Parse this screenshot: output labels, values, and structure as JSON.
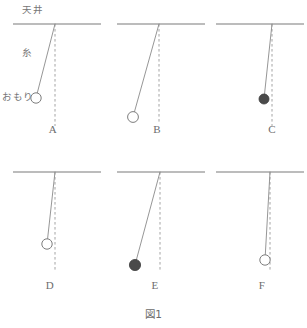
{
  "figure": {
    "caption": "図1",
    "annotations": {
      "ceiling_label": "天井",
      "string_label": "糸",
      "bob_label": "おもり"
    },
    "colors": {
      "ceiling_stroke": "#7a7a7a",
      "string_stroke": "#8a8a8a",
      "dashed_stroke": "#9a9a9a",
      "bob_open_fill": "#ffffff",
      "bob_open_stroke": "#7d7d7d",
      "bob_filled_fill": "#4a4a4a",
      "text_color": "#6d6d6d",
      "background": "#ffffff"
    }
  },
  "panels": [
    {
      "label": "A",
      "bob_style": "open",
      "pivot_x": 55,
      "pivot_y": 24,
      "ceiling_x1": 13,
      "ceiling_x2": 101,
      "bob_x": 36,
      "bob_y": 98,
      "bob_r": 5.2,
      "dash_y2": 126,
      "label_x": 53,
      "label_y": 123
    },
    {
      "label": "B",
      "bob_style": "open",
      "pivot_x": 159,
      "pivot_y": 24,
      "ceiling_x1": 117,
      "ceiling_x2": 205,
      "bob_x": 133,
      "bob_y": 117,
      "bob_r": 5.4,
      "dash_y2": 124,
      "label_x": 157,
      "label_y": 123
    },
    {
      "label": "C",
      "bob_style": "filled",
      "pivot_x": 272,
      "pivot_y": 24,
      "ceiling_x1": 216,
      "ceiling_x2": 304,
      "bob_x": 264,
      "bob_y": 99,
      "bob_r": 5.0,
      "dash_y2": 126,
      "label_x": 272,
      "label_y": 123
    },
    {
      "label": "D",
      "bob_style": "open",
      "pivot_x": 55,
      "pivot_y": 172,
      "ceiling_x1": 13,
      "ceiling_x2": 101,
      "bob_x": 47,
      "bob_y": 244,
      "bob_r": 5.2,
      "dash_y2": 272,
      "label_x": 50,
      "label_y": 279
    },
    {
      "label": "E",
      "bob_style": "filled",
      "pivot_x": 160,
      "pivot_y": 172,
      "ceiling_x1": 117,
      "ceiling_x2": 205,
      "bob_x": 135,
      "bob_y": 265,
      "bob_r": 5.6,
      "dash_y2": 272,
      "label_x": 155,
      "label_y": 279
    },
    {
      "label": "F",
      "bob_style": "open",
      "pivot_x": 270,
      "pivot_y": 172,
      "ceiling_x1": 216,
      "ceiling_x2": 304,
      "bob_x": 265,
      "bob_y": 260,
      "bob_r": 5.2,
      "dash_y2": 272,
      "label_x": 262,
      "label_y": 279
    }
  ],
  "annotation_positions": {
    "ceiling_label_x": 22,
    "ceiling_label_y": 2,
    "string_label_x": 22,
    "string_label_y": 45,
    "bob_label_x": 2,
    "bob_label_y": 89
  }
}
